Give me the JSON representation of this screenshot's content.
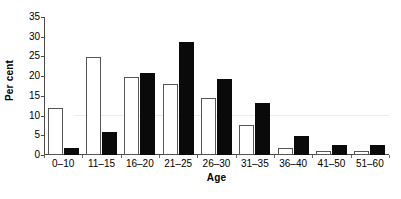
{
  "chart_data": {
    "type": "bar",
    "title": "",
    "subtitle": "",
    "xlabel": "Age",
    "ylabel": "Per cent",
    "categories": [
      "0–10",
      "11–15",
      "16–20",
      "21–25",
      "26–30",
      "31–35",
      "36–40",
      "41–50",
      "51–60"
    ],
    "series": [
      {
        "name": "white-bars",
        "fill": "#ffffff",
        "stroke": "#555555",
        "values": [
          12.0,
          24.8,
          19.7,
          17.9,
          14.5,
          7.6,
          1.8,
          0.9,
          0.9
        ]
      },
      {
        "name": "black-bars",
        "fill": "#0a0a0a",
        "stroke": "#0a0a0a",
        "values": [
          1.7,
          5.8,
          20.9,
          28.6,
          19.2,
          13.3,
          4.9,
          2.5,
          2.5
        ]
      }
    ],
    "ylim": [
      0,
      35
    ],
    "yticks": [
      0,
      5,
      10,
      15,
      20,
      25,
      30,
      35
    ],
    "ytick_labels": [
      "0",
      "5",
      "10",
      "15",
      "20",
      "25",
      "30",
      "35"
    ],
    "grid": false,
    "legend": "none",
    "axis_color": "#4a4a4a",
    "background": "#ffffff"
  }
}
